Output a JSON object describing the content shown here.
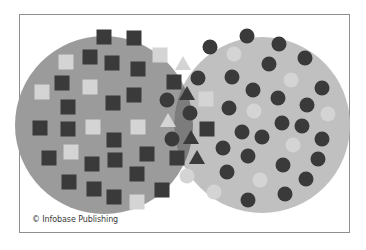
{
  "credit": "© Infobase Publishing",
  "colors": {
    "left_set": "#9b9b9b",
    "right_set": "#c0c0c0",
    "intersection": "#7c7c7c",
    "dark_shape": "#3a3a3a",
    "light_shape": "#d4d4d4",
    "frame_border": "#8f8f8f"
  },
  "sets": {
    "left": {
      "label": "squares set",
      "cx": 104,
      "cy": 125,
      "r": 89,
      "shape": "square"
    },
    "right": {
      "label": "circles set",
      "cx": 262,
      "cy": 125,
      "r": 88,
      "shape": "circle"
    }
  },
  "left_squares": [
    {
      "x": 104,
      "y": 37,
      "tone": "dark"
    },
    {
      "x": 134,
      "y": 38,
      "tone": "dark"
    },
    {
      "x": 160,
      "y": 55,
      "tone": "light"
    },
    {
      "x": 66,
      "y": 62,
      "tone": "light"
    },
    {
      "x": 90,
      "y": 57,
      "tone": "dark"
    },
    {
      "x": 112,
      "y": 63,
      "tone": "dark"
    },
    {
      "x": 138,
      "y": 69,
      "tone": "dark"
    },
    {
      "x": 62,
      "y": 83,
      "tone": "dark"
    },
    {
      "x": 90,
      "y": 87,
      "tone": "light"
    },
    {
      "x": 42,
      "y": 92,
      "tone": "light"
    },
    {
      "x": 134,
      "y": 95,
      "tone": "dark"
    },
    {
      "x": 113,
      "y": 103,
      "tone": "dark"
    },
    {
      "x": 68,
      "y": 107,
      "tone": "dark"
    },
    {
      "x": 40,
      "y": 128,
      "tone": "dark"
    },
    {
      "x": 68,
      "y": 129,
      "tone": "dark"
    },
    {
      "x": 93,
      "y": 127,
      "tone": "light"
    },
    {
      "x": 138,
      "y": 127,
      "tone": "light"
    },
    {
      "x": 114,
      "y": 140,
      "tone": "dark"
    },
    {
      "x": 71,
      "y": 152,
      "tone": "light"
    },
    {
      "x": 147,
      "y": 154,
      "tone": "dark"
    },
    {
      "x": 49,
      "y": 158,
      "tone": "dark"
    },
    {
      "x": 92,
      "y": 164,
      "tone": "dark"
    },
    {
      "x": 115,
      "y": 160,
      "tone": "dark"
    },
    {
      "x": 137,
      "y": 174,
      "tone": "dark"
    },
    {
      "x": 69,
      "y": 182,
      "tone": "dark"
    },
    {
      "x": 94,
      "y": 189,
      "tone": "dark"
    },
    {
      "x": 162,
      "y": 190,
      "tone": "dark"
    },
    {
      "x": 114,
      "y": 197,
      "tone": "dark"
    },
    {
      "x": 137,
      "y": 202,
      "tone": "light"
    }
  ],
  "right_circles": [
    {
      "x": 210,
      "y": 47,
      "tone": "dark"
    },
    {
      "x": 247,
      "y": 36,
      "tone": "dark"
    },
    {
      "x": 279,
      "y": 44,
      "tone": "dark"
    },
    {
      "x": 234,
      "y": 54,
      "tone": "light"
    },
    {
      "x": 305,
      "y": 58,
      "tone": "dark"
    },
    {
      "x": 269,
      "y": 64,
      "tone": "dark"
    },
    {
      "x": 232,
      "y": 77,
      "tone": "dark"
    },
    {
      "x": 291,
      "y": 80,
      "tone": "light"
    },
    {
      "x": 253,
      "y": 90,
      "tone": "dark"
    },
    {
      "x": 322,
      "y": 88,
      "tone": "dark"
    },
    {
      "x": 278,
      "y": 98,
      "tone": "dark"
    },
    {
      "x": 229,
      "y": 108,
      "tone": "dark"
    },
    {
      "x": 254,
      "y": 111,
      "tone": "light"
    },
    {
      "x": 307,
      "y": 105,
      "tone": "dark"
    },
    {
      "x": 328,
      "y": 114,
      "tone": "light"
    },
    {
      "x": 282,
      "y": 123,
      "tone": "dark"
    },
    {
      "x": 302,
      "y": 126,
      "tone": "dark"
    },
    {
      "x": 242,
      "y": 132,
      "tone": "dark"
    },
    {
      "x": 262,
      "y": 137,
      "tone": "dark"
    },
    {
      "x": 322,
      "y": 139,
      "tone": "dark"
    },
    {
      "x": 293,
      "y": 145,
      "tone": "light"
    },
    {
      "x": 223,
      "y": 148,
      "tone": "dark"
    },
    {
      "x": 248,
      "y": 156,
      "tone": "dark"
    },
    {
      "x": 318,
      "y": 159,
      "tone": "dark"
    },
    {
      "x": 283,
      "y": 165,
      "tone": "dark"
    },
    {
      "x": 227,
      "y": 172,
      "tone": "dark"
    },
    {
      "x": 260,
      "y": 180,
      "tone": "light"
    },
    {
      "x": 306,
      "y": 179,
      "tone": "dark"
    },
    {
      "x": 214,
      "y": 192,
      "tone": "light"
    },
    {
      "x": 285,
      "y": 194,
      "tone": "dark"
    },
    {
      "x": 248,
      "y": 200,
      "tone": "dark"
    }
  ],
  "intersection_shapes": [
    {
      "type": "triangle",
      "x": 183,
      "y": 63,
      "tone": "light"
    },
    {
      "type": "square",
      "x": 174,
      "y": 82,
      "tone": "dark"
    },
    {
      "type": "circle",
      "x": 198,
      "y": 78,
      "tone": "dark"
    },
    {
      "type": "triangle",
      "x": 187,
      "y": 93,
      "tone": "dark"
    },
    {
      "type": "circle",
      "x": 167,
      "y": 100,
      "tone": "dark"
    },
    {
      "type": "square",
      "x": 206,
      "y": 99,
      "tone": "light"
    },
    {
      "type": "circle",
      "x": 190,
      "y": 113,
      "tone": "dark"
    },
    {
      "type": "triangle",
      "x": 168,
      "y": 120,
      "tone": "light"
    },
    {
      "type": "square",
      "x": 207,
      "y": 129,
      "tone": "dark"
    },
    {
      "type": "circle",
      "x": 172,
      "y": 139,
      "tone": "dark"
    },
    {
      "type": "triangle",
      "x": 191,
      "y": 137,
      "tone": "dark"
    },
    {
      "type": "square",
      "x": 177,
      "y": 158,
      "tone": "dark"
    },
    {
      "type": "triangle",
      "x": 197,
      "y": 157,
      "tone": "dark"
    },
    {
      "type": "circle",
      "x": 187,
      "y": 176,
      "tone": "light"
    }
  ]
}
